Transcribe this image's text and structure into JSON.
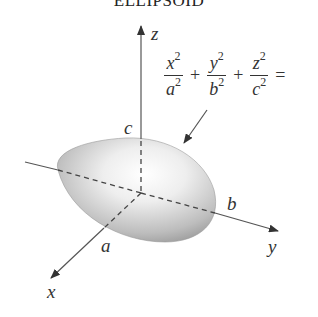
{
  "title": "ELLIPSOID",
  "axes": {
    "x": "x",
    "y": "y",
    "z": "z"
  },
  "intercepts": {
    "a": "a",
    "b": "b",
    "c": "c"
  },
  "equation": {
    "terms": [
      {
        "num": "x",
        "num_exp": "2",
        "den": "a",
        "den_exp": "2"
      },
      {
        "num": "y",
        "num_exp": "2",
        "den": "b",
        "den_exp": "2"
      },
      {
        "num": "z",
        "num_exp": "2",
        "den": "c",
        "den_exp": "2"
      }
    ],
    "plus": "+",
    "equals": "="
  },
  "colors": {
    "surface_light": "#ffffff",
    "surface_dark": "#8a8a8a",
    "axis": "#555555",
    "text": "#333333"
  }
}
